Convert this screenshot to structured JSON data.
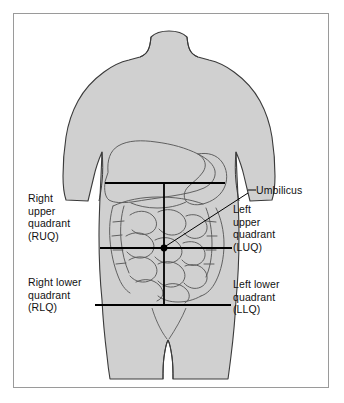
{
  "figure": {
    "border_color": "#9a9a9a",
    "body_fill": "#d0d0d0",
    "outline_color": "#3a3a3a",
    "organ_line_color": "#5a5a5a",
    "quadrant_line_color": "#000000",
    "text_color": "#111111"
  },
  "labels": {
    "right_upper": "Right\nupper\nquadrant\n(RUQ)",
    "right_lower": "Right lower\nquadrant\n(RLQ)",
    "left_upper": "Left\nupper\nquadrant\n(LUQ)",
    "left_lower": "Left lower\nquadrant\n(LLQ)",
    "umbilicus": "Umbilicus"
  },
  "markers": {
    "umbilicus_point": {
      "x": 164,
      "y": 248
    }
  },
  "quadrant_lines": {
    "vertical": {
      "x": 164,
      "y1": 183,
      "y2": 305
    },
    "horizontal_top": {
      "y": 183,
      "x1": 105,
      "x2": 225
    },
    "horizontal_middle": {
      "y": 248,
      "x1": 100,
      "x2": 232
    },
    "horizontal_bottom": {
      "y": 305,
      "x1": 95,
      "x2": 231
    }
  }
}
